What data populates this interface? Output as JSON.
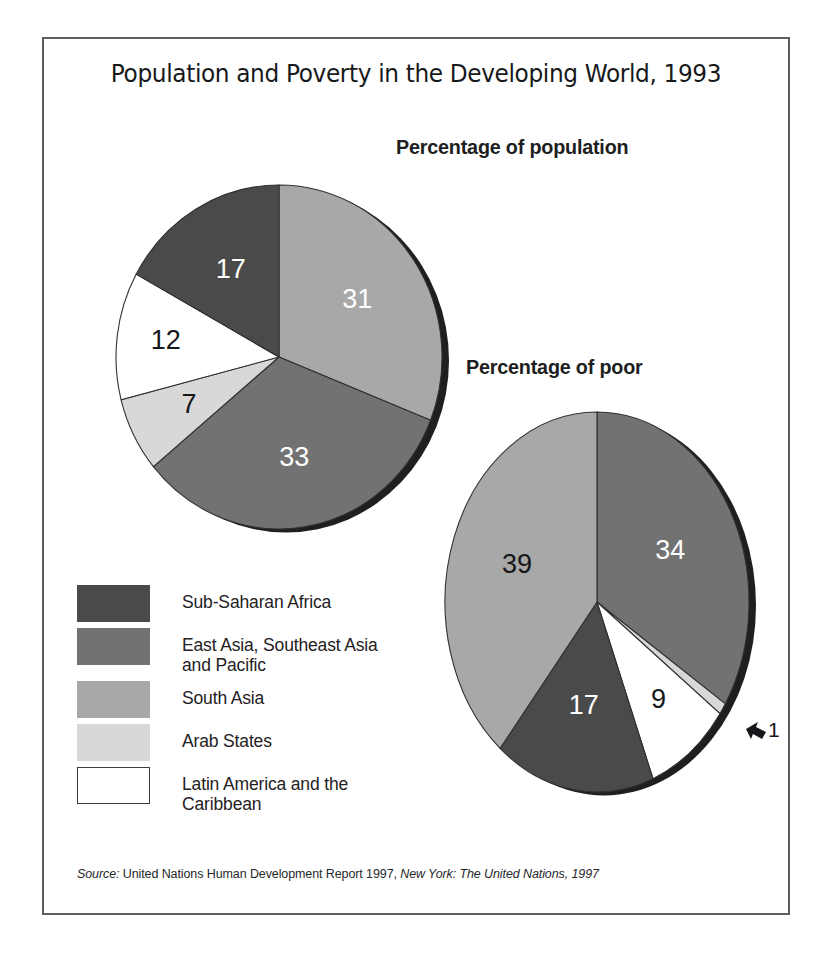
{
  "title": "Population and Poverty in the Developing World, 1993",
  "headings": {
    "population": "Percentage of population",
    "poor": "Percentage of poor"
  },
  "legend": {
    "items": [
      {
        "label": "Sub-Saharan Africa",
        "color": "#4a4a4a"
      },
      {
        "label": "East Asia, Southeast Asia\nand Pacific",
        "color": "#727272"
      },
      {
        "label": "South Asia",
        "color": "#a8a8a8"
      },
      {
        "label": "Arab States",
        "color": "#d8d8d8"
      },
      {
        "label": "Latin America and the\nCaribbean",
        "color": "#ffffff"
      }
    ]
  },
  "source": {
    "key": "Source:",
    "text": " United Nations Human Development Report 1997, ",
    "publisher": "New York: The United Nations, 1997"
  },
  "callout": {
    "value": "1",
    "arrow": "arrow-left-icon"
  },
  "chart_data": [
    {
      "type": "pie",
      "title": "Percentage of population",
      "categories": [
        "South Asia",
        "East Asia, Southeast Asia and Pacific",
        "Arab States",
        "Latin America and the Caribbean",
        "Sub-Saharan Africa"
      ],
      "values": [
        31,
        33,
        7,
        12,
        17
      ],
      "labels": [
        "31",
        "33",
        "7",
        "12",
        "17"
      ],
      "colors": [
        "#a8a8a8",
        "#727272",
        "#d8d8d8",
        "#ffffff",
        "#4a4a4a"
      ],
      "label_colors": [
        "light",
        "light",
        "dark",
        "dark",
        "light"
      ],
      "start_angle": 0,
      "direction": "clockwise",
      "units": "percent"
    },
    {
      "type": "pie",
      "title": "Percentage of poor",
      "categories": [
        "East Asia, Southeast Asia and Pacific",
        "Arab States",
        "Latin America and the Caribbean",
        "Sub-Saharan Africa",
        "South Asia"
      ],
      "values": [
        34,
        1,
        9,
        17,
        39
      ],
      "labels": [
        "34",
        "1",
        "9",
        "17",
        "39"
      ],
      "colors": [
        "#727272",
        "#d8d8d8",
        "#ffffff",
        "#4a4a4a",
        "#a8a8a8"
      ],
      "label_colors": [
        "light",
        "dark",
        "dark",
        "light",
        "dark"
      ],
      "start_angle": 0,
      "direction": "clockwise",
      "units": "percent"
    }
  ]
}
